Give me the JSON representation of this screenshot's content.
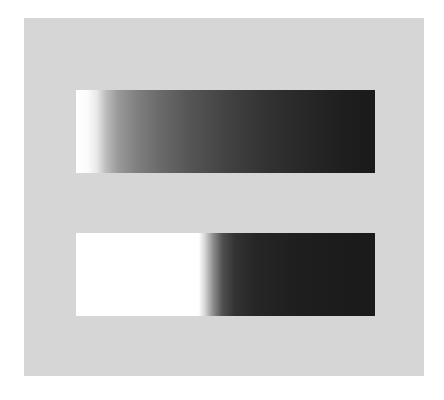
{
  "figure": {
    "background_color": "#ffffff",
    "panel_color": "#d6d6d6",
    "bars": [
      {
        "id": "top",
        "type": "gradual-gradient",
        "start_color": "#ffffff",
        "end_color": "#1a1a1a"
      },
      {
        "id": "bottom",
        "type": "sharp-step-gradient",
        "start_color": "#ffffff",
        "end_color": "#1a1a1a"
      }
    ]
  }
}
